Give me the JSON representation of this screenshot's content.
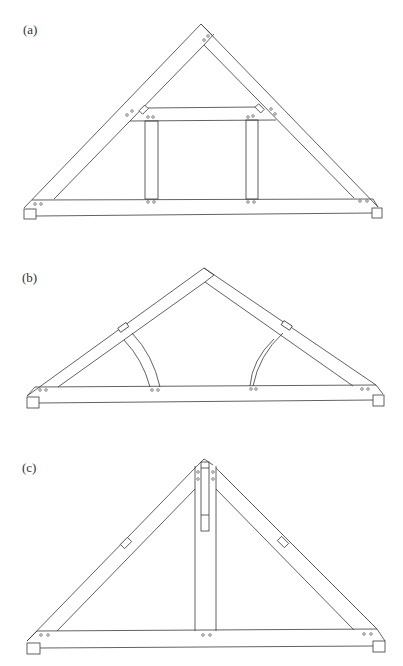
{
  "figures": [
    {
      "label": "(a)",
      "name": "queen-post-truss",
      "description": "Truss with collar tie and two queen posts"
    },
    {
      "label": "(b)",
      "name": "arched-brace-truss",
      "description": "Truss with two curved braces"
    },
    {
      "label": "(c)",
      "name": "king-post-truss",
      "description": "Truss with central king post"
    }
  ],
  "colors": {
    "line": "#3a3a3a",
    "background": "#ffffff"
  }
}
